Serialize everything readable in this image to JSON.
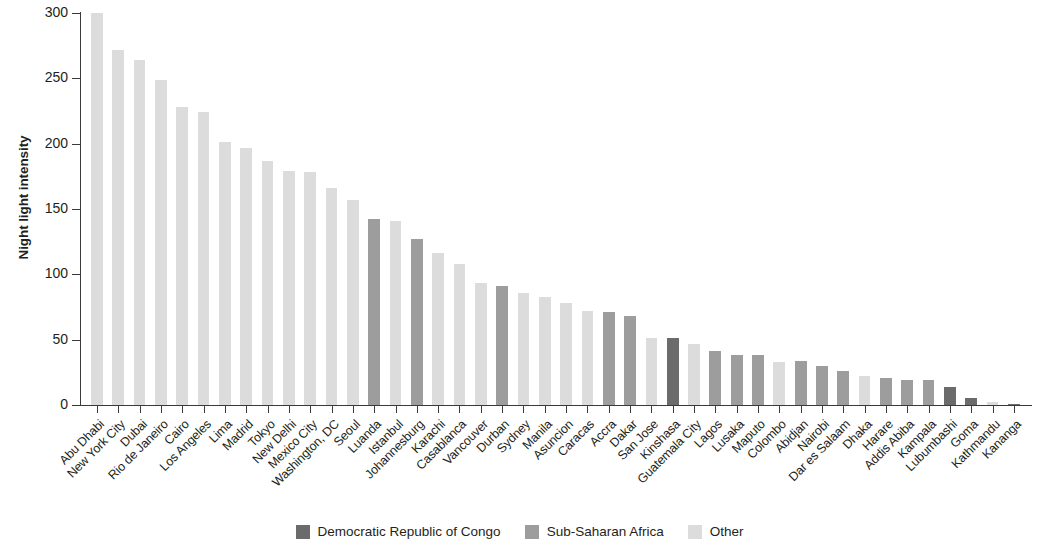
{
  "chart_data": {
    "type": "bar",
    "title": "",
    "xlabel": "",
    "ylabel": "Night light intensity",
    "ylim": [
      0,
      300
    ],
    "yticks": [
      0,
      50,
      100,
      150,
      200,
      250,
      300
    ],
    "grid": false,
    "legend_position": "bottom",
    "categories": [
      "Abu Dhabi",
      "New York City",
      "Dubai",
      "Rio de Janeiro",
      "Cairo",
      "Los Angeles",
      "Lima",
      "Madrid",
      "Tokyo",
      "New Delhi",
      "Mexico City",
      "Washington, DC",
      "Seoul",
      "Luanda",
      "Istanbul",
      "Johannesburg",
      "Karachi",
      "Casablanca",
      "Vancouver",
      "Durban",
      "Sydney",
      "Manila",
      "Asuncion",
      "Caracas",
      "Accra",
      "Dakar",
      "San Jose",
      "Kinshasa",
      "Guatemala City",
      "Lagos",
      "Lusaka",
      "Maputo",
      "Colombo",
      "Abidjan",
      "Nairobi",
      "Dar es Salaam",
      "Dhaka",
      "Harare",
      "Addis Abiba",
      "Kampala",
      "Lubumbashi",
      "Goma",
      "Kathmandu",
      "Kananga"
    ],
    "values": [
      300,
      272,
      264,
      249,
      228,
      224,
      201,
      197,
      187,
      179,
      178,
      166,
      157,
      142,
      141,
      127,
      116,
      108,
      93,
      91,
      86,
      83,
      78,
      72,
      71,
      68,
      51,
      51,
      47,
      41,
      38,
      38,
      33,
      34,
      30,
      26,
      22,
      21,
      19,
      19,
      14,
      5,
      2,
      1
    ],
    "groups": [
      "Other",
      "Other",
      "Other",
      "Other",
      "Other",
      "Other",
      "Other",
      "Other",
      "Other",
      "Other",
      "Other",
      "Other",
      "Other",
      "Sub-Saharan Africa",
      "Other",
      "Sub-Saharan Africa",
      "Other",
      "Other",
      "Other",
      "Sub-Saharan Africa",
      "Other",
      "Other",
      "Other",
      "Other",
      "Sub-Saharan Africa",
      "Sub-Saharan Africa",
      "Other",
      "Democratic Republic of Congo",
      "Other",
      "Sub-Saharan Africa",
      "Sub-Saharan Africa",
      "Sub-Saharan Africa",
      "Other",
      "Sub-Saharan Africa",
      "Sub-Saharan Africa",
      "Sub-Saharan Africa",
      "Other",
      "Sub-Saharan Africa",
      "Sub-Saharan Africa",
      "Sub-Saharan Africa",
      "Democratic Republic of Congo",
      "Democratic Republic of Congo",
      "Other",
      "Democratic Republic of Congo"
    ],
    "series": [
      {
        "name": "Democratic Republic of Congo",
        "color": "#6b6b6b",
        "values": [
          null,
          null,
          null,
          null,
          null,
          null,
          null,
          null,
          null,
          null,
          null,
          null,
          null,
          null,
          null,
          null,
          null,
          null,
          null,
          null,
          null,
          null,
          null,
          null,
          null,
          null,
          null,
          51,
          null,
          null,
          null,
          null,
          null,
          null,
          null,
          null,
          null,
          null,
          null,
          null,
          14,
          5,
          null,
          1
        ]
      },
      {
        "name": "Sub-Saharan Africa",
        "color": "#9d9d9d",
        "values": [
          null,
          null,
          null,
          null,
          null,
          null,
          null,
          null,
          null,
          null,
          null,
          null,
          null,
          142,
          null,
          127,
          null,
          null,
          null,
          91,
          null,
          null,
          null,
          null,
          71,
          68,
          null,
          null,
          null,
          41,
          38,
          38,
          null,
          34,
          30,
          26,
          null,
          21,
          19,
          19,
          null,
          null,
          null,
          null
        ]
      },
      {
        "name": "Other",
        "color": "#dcdcdc",
        "values": [
          300,
          272,
          264,
          249,
          228,
          224,
          201,
          197,
          187,
          179,
          178,
          166,
          157,
          null,
          141,
          null,
          116,
          108,
          93,
          null,
          86,
          83,
          78,
          72,
          null,
          null,
          51,
          null,
          47,
          null,
          null,
          null,
          33,
          null,
          null,
          null,
          22,
          null,
          null,
          null,
          null,
          null,
          2,
          null
        ]
      }
    ]
  },
  "legend": {
    "items": [
      {
        "label": "Democratic Republic of Congo",
        "color": "#6b6b6b"
      },
      {
        "label": "Sub-Saharan Africa",
        "color": "#9d9d9d"
      },
      {
        "label": "Other",
        "color": "#dcdcdc"
      }
    ]
  },
  "axes": {
    "y_title": "Night light intensity",
    "y_tick_labels": [
      "0",
      "50",
      "100",
      "150",
      "200",
      "250",
      "300"
    ]
  },
  "colors": {
    "axis": "#3a3a3a",
    "text": "#231f20",
    "background": "#ffffff"
  }
}
